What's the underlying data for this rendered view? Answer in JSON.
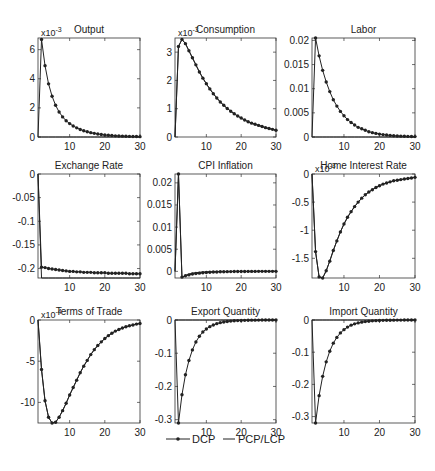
{
  "figure": {
    "legend": {
      "dcp_label": "DCP",
      "pcp_label": "PCP/LCP",
      "placement": "bottom-center"
    }
  },
  "chart_data": [
    {
      "type": "line",
      "title": "Output",
      "exponent_label": "x10",
      "exponent": "-3",
      "xlim": [
        1,
        30
      ],
      "ylim": [
        0,
        6.8
      ],
      "xticks": [
        10,
        20,
        30
      ],
      "yticks": [
        0,
        2,
        4,
        6
      ],
      "ytick_labels": [
        "0",
        "2",
        "4",
        "6"
      ],
      "x": [
        1,
        2,
        3,
        4,
        5,
        6,
        7,
        8,
        9,
        10,
        11,
        12,
        13,
        14,
        15,
        16,
        17,
        18,
        19,
        20,
        21,
        22,
        23,
        24,
        25,
        26,
        27,
        28,
        29,
        30
      ],
      "series": [
        {
          "name": "DCP",
          "values": [
            0,
            6.7,
            4.9,
            3.65,
            2.8,
            2.18,
            1.72,
            1.38,
            1.12,
            0.92,
            0.76,
            0.63,
            0.52,
            0.43,
            0.36,
            0.3,
            0.25,
            0.21,
            0.17,
            0.14,
            0.12,
            0.1,
            0.08,
            0.07,
            0.06,
            0.05,
            0.04,
            0.035,
            0.03,
            0.025
          ]
        },
        {
          "name": "PCP/LCP",
          "values": [
            0,
            0,
            0,
            0,
            0,
            0,
            0,
            0,
            0,
            0,
            0,
            0,
            0,
            0,
            0,
            0,
            0,
            0,
            0,
            0,
            0,
            0,
            0,
            0,
            0,
            0,
            0,
            0,
            0,
            0
          ]
        }
      ]
    },
    {
      "type": "line",
      "title": "Consumption",
      "exponent_label": "x10",
      "exponent": "-3",
      "xlim": [
        1,
        30
      ],
      "ylim": [
        0,
        3.5
      ],
      "xticks": [
        10,
        20,
        30
      ],
      "yticks": [
        0,
        1,
        2,
        3
      ],
      "ytick_labels": [
        "0",
        "1",
        "2",
        "3"
      ],
      "x": [
        1,
        2,
        3,
        4,
        5,
        6,
        7,
        8,
        9,
        10,
        11,
        12,
        13,
        14,
        15,
        16,
        17,
        18,
        19,
        20,
        21,
        22,
        23,
        24,
        25,
        26,
        27,
        28,
        29,
        30
      ],
      "series": [
        {
          "name": "DCP",
          "values": [
            0,
            3.2,
            3.45,
            3.3,
            3.05,
            2.8,
            2.55,
            2.3,
            2.08,
            1.88,
            1.7,
            1.53,
            1.38,
            1.24,
            1.12,
            1.01,
            0.91,
            0.82,
            0.74,
            0.67,
            0.6,
            0.54,
            0.49,
            0.45,
            0.41,
            0.37,
            0.33,
            0.3,
            0.27,
            0.24
          ]
        },
        {
          "name": "PCP/LCP",
          "values": [
            0,
            3.2,
            3.45,
            3.3,
            3.05,
            2.8,
            2.55,
            2.3,
            2.08,
            1.88,
            1.7,
            1.53,
            1.38,
            1.24,
            1.12,
            1.01,
            0.91,
            0.82,
            0.74,
            0.67,
            0.6,
            0.54,
            0.49,
            0.45,
            0.41,
            0.37,
            0.33,
            0.3,
            0.27,
            0.24
          ]
        }
      ]
    },
    {
      "type": "line",
      "title": "Labor",
      "exponent_label": "",
      "exponent": "",
      "xlim": [
        1,
        30
      ],
      "ylim": [
        0,
        0.0205
      ],
      "xticks": [
        10,
        20,
        30
      ],
      "yticks": [
        0,
        0.005,
        0.01,
        0.015,
        0.02
      ],
      "ytick_labels": [
        "0",
        "0.005",
        "0.01",
        "0.015",
        "0.02"
      ],
      "x": [
        1,
        2,
        3,
        4,
        5,
        6,
        7,
        8,
        9,
        10,
        11,
        12,
        13,
        14,
        15,
        16,
        17,
        18,
        19,
        20,
        21,
        22,
        23,
        24,
        25,
        26,
        27,
        28,
        29,
        30
      ],
      "series": [
        {
          "name": "DCP",
          "values": [
            0,
            0.0205,
            0.0168,
            0.0138,
            0.0114,
            0.0094,
            0.0077,
            0.0064,
            0.0053,
            0.0044,
            0.0036,
            0.003,
            0.0025,
            0.002,
            0.0017,
            0.0014,
            0.0011,
            0.0009,
            0.00075,
            0.0006,
            0.0005,
            0.0004,
            0.00033,
            0.00027,
            0.00022,
            0.00018,
            0.00015,
            0.00012,
            0.0001,
            8e-05
          ]
        },
        {
          "name": "PCP/LCP",
          "values": [
            0,
            0,
            0,
            0,
            0,
            0,
            0,
            0,
            0,
            0,
            0,
            0,
            0,
            0,
            0,
            0,
            0,
            0,
            0,
            0,
            0,
            0,
            0,
            0,
            0,
            0,
            0,
            0,
            0,
            0
          ]
        }
      ]
    },
    {
      "type": "line",
      "title": "Exchange Rate",
      "exponent_label": "",
      "exponent": "",
      "xlim": [
        1,
        30
      ],
      "ylim": [
        -0.22,
        0
      ],
      "xticks": [
        10,
        20,
        30
      ],
      "yticks": [
        -0.2,
        -0.15,
        -0.1,
        -0.05,
        0
      ],
      "ytick_labels": [
        "-0.2",
        "-0.15",
        "-0.1",
        "-0.05",
        "0"
      ],
      "x": [
        1,
        2,
        3,
        4,
        5,
        6,
        7,
        8,
        9,
        10,
        11,
        12,
        13,
        14,
        15,
        16,
        17,
        18,
        19,
        20,
        21,
        22,
        23,
        24,
        25,
        26,
        27,
        28,
        29,
        30
      ],
      "series": [
        {
          "name": "DCP",
          "values": [
            0,
            -0.197,
            -0.198,
            -0.2,
            -0.201,
            -0.202,
            -0.203,
            -0.204,
            -0.205,
            -0.206,
            -0.206,
            -0.207,
            -0.207,
            -0.208,
            -0.208,
            -0.208,
            -0.209,
            -0.209,
            -0.209,
            -0.209,
            -0.21,
            -0.21,
            -0.21,
            -0.21,
            -0.21,
            -0.21,
            -0.211,
            -0.211,
            -0.211,
            -0.211
          ]
        },
        {
          "name": "PCP/LCP",
          "values": [
            0,
            -0.22,
            -0.22,
            -0.22,
            -0.22,
            -0.22,
            -0.22,
            -0.22,
            -0.22,
            -0.22,
            -0.22,
            -0.22,
            -0.22,
            -0.22,
            -0.22,
            -0.22,
            -0.22,
            -0.22,
            -0.22,
            -0.22,
            -0.22,
            -0.22,
            -0.22,
            -0.22,
            -0.22,
            -0.22,
            -0.22,
            -0.22,
            -0.22,
            -0.22
          ]
        }
      ]
    },
    {
      "type": "line",
      "title": "CPI Inflation",
      "exponent_label": "",
      "exponent": "",
      "xlim": [
        1,
        30
      ],
      "ylim": [
        -0.0015,
        0.022
      ],
      "xticks": [
        10,
        20,
        30
      ],
      "yticks": [
        0,
        0.005,
        0.01,
        0.015,
        0.02
      ],
      "ytick_labels": [
        "0",
        "0.005",
        "0.01",
        "0.015",
        "0.02"
      ],
      "x": [
        1,
        2,
        3,
        4,
        5,
        6,
        7,
        8,
        9,
        10,
        11,
        12,
        13,
        14,
        15,
        16,
        17,
        18,
        19,
        20,
        21,
        22,
        23,
        24,
        25,
        26,
        27,
        28,
        29,
        30
      ],
      "series": [
        {
          "name": "DCP",
          "values": [
            0,
            0.022,
            -0.0013,
            -0.001,
            -0.0008,
            -0.0006,
            -0.0005,
            -0.0004,
            -0.0003,
            -0.00025,
            -0.0002,
            -0.00016,
            -0.00013,
            -0.0001,
            -8e-05,
            -6e-05,
            -5e-05,
            -4e-05,
            -3e-05,
            -2e-05,
            -2e-05,
            -1e-05,
            -1e-05,
            -1e-05,
            0,
            0,
            0,
            0,
            0,
            0
          ]
        },
        {
          "name": "PCP/LCP",
          "values": [
            0,
            0.022,
            -0.0015,
            -0.0009,
            -0.0006,
            -0.0004,
            -0.0003,
            -0.0002,
            -0.00015,
            -0.0001,
            -8e-05,
            -6e-05,
            -4e-05,
            -3e-05,
            -2e-05,
            -1e-05,
            -1e-05,
            0,
            0,
            0,
            0,
            0,
            0,
            0,
            0,
            0,
            0,
            0,
            0,
            0
          ]
        }
      ]
    },
    {
      "type": "line",
      "title": "Home Interest Rate",
      "exponent_label": "x10",
      "exponent": "-3",
      "xlim": [
        1,
        30
      ],
      "ylim": [
        -1.85,
        0
      ],
      "xticks": [
        10,
        20,
        30
      ],
      "yticks": [
        -1.5,
        -1,
        -0.5,
        0
      ],
      "ytick_labels": [
        "-1.5",
        "-1",
        "-0.5",
        "0"
      ],
      "x": [
        1,
        2,
        3,
        4,
        5,
        6,
        7,
        8,
        9,
        10,
        11,
        12,
        13,
        14,
        15,
        16,
        17,
        18,
        19,
        20,
        21,
        22,
        23,
        24,
        25,
        26,
        27,
        28,
        29,
        30
      ],
      "series": [
        {
          "name": "DCP",
          "values": [
            0,
            -1.38,
            -1.83,
            -1.85,
            -1.72,
            -1.55,
            -1.36,
            -1.19,
            -1.03,
            -0.89,
            -0.77,
            -0.67,
            -0.58,
            -0.5,
            -0.43,
            -0.37,
            -0.32,
            -0.28,
            -0.24,
            -0.21,
            -0.18,
            -0.16,
            -0.14,
            -0.12,
            -0.11,
            -0.1,
            -0.09,
            -0.08,
            -0.07,
            -0.06
          ]
        },
        {
          "name": "PCP/LCP",
          "values": [
            0,
            -1.38,
            -1.83,
            -1.85,
            -1.72,
            -1.55,
            -1.36,
            -1.19,
            -1.03,
            -0.89,
            -0.77,
            -0.67,
            -0.58,
            -0.5,
            -0.43,
            -0.37,
            -0.32,
            -0.28,
            -0.24,
            -0.21,
            -0.18,
            -0.16,
            -0.14,
            -0.12,
            -0.11,
            -0.1,
            -0.09,
            -0.08,
            -0.07,
            -0.06
          ]
        }
      ]
    },
    {
      "type": "line",
      "title": "Terms of Trade",
      "exponent_label": "x10",
      "exponent": "-4",
      "xlim": [
        1,
        30
      ],
      "ylim": [
        -12.5,
        0
      ],
      "xticks": [
        10,
        20,
        30
      ],
      "yticks": [
        -10,
        -5,
        0
      ],
      "ytick_labels": [
        "-10",
        "-5",
        "0"
      ],
      "x": [
        1,
        2,
        3,
        4,
        5,
        6,
        7,
        8,
        9,
        10,
        11,
        12,
        13,
        14,
        15,
        16,
        17,
        18,
        19,
        20,
        21,
        22,
        23,
        24,
        25,
        26,
        27,
        28,
        29,
        30
      ],
      "series": [
        {
          "name": "DCP",
          "values": [
            0,
            -6,
            -9.8,
            -11.8,
            -12.5,
            -12.4,
            -11.8,
            -11,
            -10.1,
            -9.1,
            -8.2,
            -7.3,
            -6.4,
            -5.6,
            -4.9,
            -4.2,
            -3.6,
            -3.1,
            -2.65,
            -2.25,
            -1.9,
            -1.6,
            -1.35,
            -1.15,
            -0.97,
            -0.82,
            -0.7,
            -0.6,
            -0.5,
            -0.42
          ]
        },
        {
          "name": "PCP/LCP",
          "values": [
            0,
            -6,
            -9.8,
            -11.8,
            -12.5,
            -12.4,
            -11.8,
            -11,
            -10.1,
            -9.1,
            -8.2,
            -7.3,
            -6.4,
            -5.6,
            -4.9,
            -4.2,
            -3.6,
            -3.1,
            -2.65,
            -2.25,
            -1.9,
            -1.6,
            -1.35,
            -1.15,
            -0.97,
            -0.82,
            -0.7,
            -0.6,
            -0.5,
            -0.42
          ]
        }
      ]
    },
    {
      "type": "line",
      "title": "Export Quantity",
      "exponent_label": "",
      "exponent": "",
      "xlim": [
        1,
        30
      ],
      "ylim": [
        -0.31,
        0
      ],
      "xticks": [
        10,
        20,
        30
      ],
      "yticks": [
        -0.3,
        -0.2,
        -0.1,
        0
      ],
      "ytick_labels": [
        "-0.3",
        "-0.2",
        "-0.1",
        "0"
      ],
      "x": [
        1,
        2,
        3,
        4,
        5,
        6,
        7,
        8,
        9,
        10,
        11,
        12,
        13,
        14,
        15,
        16,
        17,
        18,
        19,
        20,
        21,
        22,
        23,
        24,
        25,
        26,
        27,
        28,
        29,
        30
      ],
      "series": [
        {
          "name": "DCP",
          "values": [
            0,
            -0.31,
            -0.225,
            -0.165,
            -0.122,
            -0.09,
            -0.066,
            -0.049,
            -0.036,
            -0.027,
            -0.02,
            -0.015,
            -0.011,
            -0.008,
            -0.006,
            -0.0045,
            -0.0033,
            -0.0024,
            -0.0018,
            -0.0013,
            -0.001,
            -0.0007,
            -0.0005,
            -0.0004,
            -0.0003,
            -0.0002,
            -0.0002,
            -0.0001,
            -0.0001,
            -0.0001
          ]
        },
        {
          "name": "PCP/LCP",
          "values": [
            0,
            0,
            0,
            0,
            0,
            0,
            0,
            0,
            0,
            0,
            0,
            0,
            0,
            0,
            0,
            0,
            0,
            0,
            0,
            0,
            0,
            0,
            0,
            0,
            0,
            0,
            0,
            0,
            0,
            0
          ]
        }
      ]
    },
    {
      "type": "line",
      "title": "Import Quantity",
      "exponent_label": "",
      "exponent": "",
      "xlim": [
        1,
        30
      ],
      "ylim": [
        -0.32,
        0
      ],
      "xticks": [
        10,
        20,
        30
      ],
      "yticks": [
        -0.3,
        -0.2,
        -0.1,
        0
      ],
      "ytick_labels": [
        "-0.3",
        "-0.2",
        "-0.1",
        "0"
      ],
      "x": [
        1,
        2,
        3,
        4,
        5,
        6,
        7,
        8,
        9,
        10,
        11,
        12,
        13,
        14,
        15,
        16,
        17,
        18,
        19,
        20,
        21,
        22,
        23,
        24,
        25,
        26,
        27,
        28,
        29,
        30
      ],
      "series": [
        {
          "name": "DCP",
          "values": [
            0,
            -0.32,
            -0.235,
            -0.175,
            -0.13,
            -0.097,
            -0.072,
            -0.054,
            -0.04,
            -0.03,
            -0.022,
            -0.016,
            -0.012,
            -0.009,
            -0.0067,
            -0.005,
            -0.0037,
            -0.0027,
            -0.002,
            -0.0015,
            -0.0011,
            -0.0008,
            -0.0006,
            -0.0005,
            -0.0003,
            -0.0003,
            -0.0002,
            -0.0002,
            -0.0001,
            -0.0001
          ]
        },
        {
          "name": "PCP/LCP",
          "values": [
            0,
            0,
            0,
            0,
            0,
            0,
            0,
            0,
            0,
            0,
            0,
            0,
            0,
            0,
            0,
            0,
            0,
            0,
            0,
            0,
            0,
            0,
            0,
            0,
            0,
            0,
            0,
            0,
            0,
            0
          ]
        }
      ]
    }
  ]
}
